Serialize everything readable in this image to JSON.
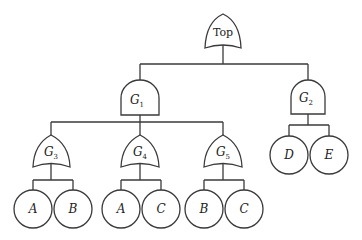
{
  "diagram": {
    "type": "fault-tree",
    "top_event": {
      "label": "Top",
      "gate": "OR"
    },
    "gates": [
      {
        "id": "G1",
        "letter": "G",
        "sub": "1",
        "type": "AND",
        "parent": "Top"
      },
      {
        "id": "G2",
        "letter": "G",
        "sub": "2",
        "type": "AND",
        "parent": "Top"
      },
      {
        "id": "G3",
        "letter": "G",
        "sub": "3",
        "type": "OR",
        "parent": "G1"
      },
      {
        "id": "G4",
        "letter": "G",
        "sub": "4",
        "type": "OR",
        "parent": "G1"
      },
      {
        "id": "G5",
        "letter": "G",
        "sub": "5",
        "type": "OR",
        "parent": "G1"
      }
    ],
    "basic_events": [
      {
        "label": "A",
        "parent": "G3"
      },
      {
        "label": "B",
        "parent": "G3"
      },
      {
        "label": "A",
        "parent": "G4"
      },
      {
        "label": "C",
        "parent": "G4"
      },
      {
        "label": "B",
        "parent": "G5"
      },
      {
        "label": "C",
        "parent": "G5"
      },
      {
        "label": "D",
        "parent": "G2"
      },
      {
        "label": "E",
        "parent": "G2"
      }
    ]
  }
}
